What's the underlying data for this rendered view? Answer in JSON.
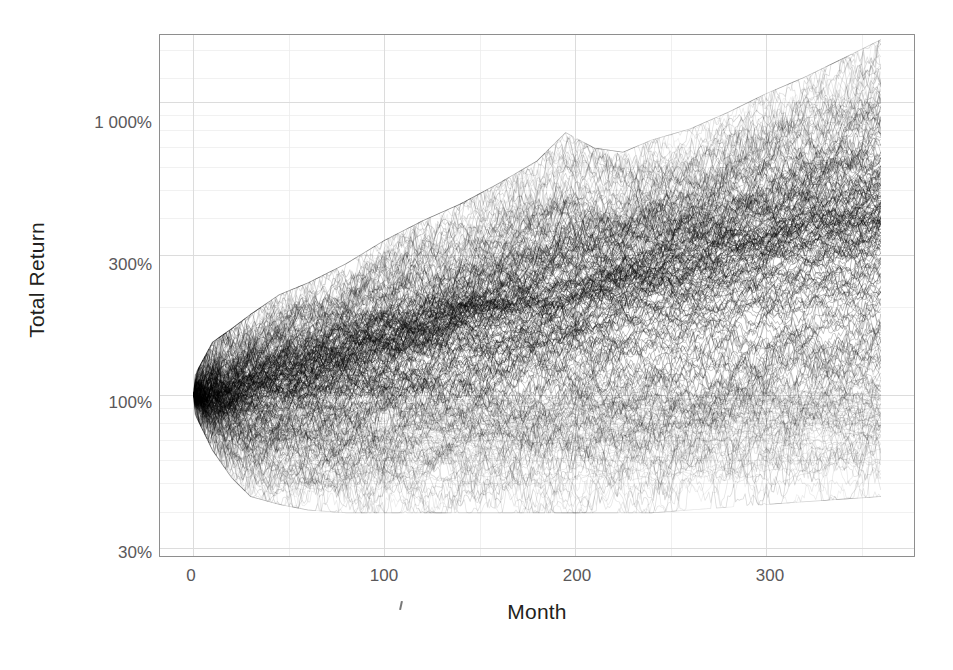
{
  "figure": {
    "background": "#ffffff",
    "axis_color": "#8e8e8e",
    "grid_color": "#dcdcdc",
    "line_color": "#000000",
    "tick_label_color": "#5a585a",
    "title_color": "#231f20"
  },
  "axes": {
    "x_title": "Month",
    "y_title": "Total Return"
  },
  "caption": {
    "text": ""
  },
  "chart_data": {
    "type": "line",
    "title": "",
    "subtitle": "",
    "xlabel": "Month",
    "ylabel": "Total Return",
    "yscale": "log",
    "xscale": "linear",
    "xlim": [
      -18,
      378
    ],
    "ylim": [
      28,
      1700
    ],
    "xticks": [
      0,
      100,
      200,
      300
    ],
    "xtick_labels": [
      "0",
      "100",
      "200",
      "300"
    ],
    "yticks": [
      30,
      100,
      300,
      1000
    ],
    "ytick_labels": [
      "30%",
      "100%",
      "300%",
      "1 000%"
    ],
    "grid": true,
    "grid_minor": true,
    "legend": null,
    "legend_position": "none",
    "n_paths": 250,
    "start_value": 100,
    "envelope": {
      "x": [
        0,
        10,
        20,
        30,
        45,
        60,
        80,
        100,
        120,
        140,
        160,
        180,
        195,
        210,
        225,
        240,
        260,
        280,
        300,
        320,
        340,
        360
      ],
      "upper": [
        102,
        135,
        150,
        168,
        196,
        215,
        250,
        300,
        350,
        400,
        470,
        560,
        700,
        620,
        600,
        660,
        720,
        820,
        950,
        1080,
        1250,
        1450
      ],
      "lower": [
        98,
        72,
        58,
        50,
        47,
        45,
        44,
        44,
        44,
        44,
        44,
        44,
        44,
        44,
        44,
        44,
        45,
        46,
        47,
        48,
        49,
        50
      ],
      "median": [
        100,
        103,
        106,
        110,
        117,
        124,
        136,
        150,
        163,
        178,
        193,
        210,
        220,
        230,
        242,
        255,
        278,
        300,
        325,
        352,
        380,
        410
      ]
    },
    "series_summary": [
      {
        "name": "upper envelope",
        "end_value": 1450
      },
      {
        "name": "median path",
        "end_value": 410
      },
      {
        "name": "lower envelope",
        "end_value": 50
      }
    ]
  }
}
